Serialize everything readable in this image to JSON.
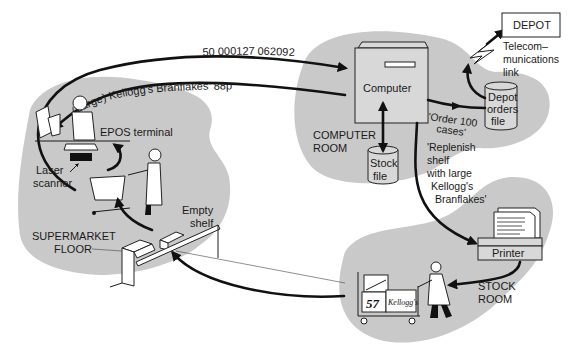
{
  "diagram": {
    "regions": {
      "supermarket_floor": "SUPERMARKET FLOOR",
      "computer_room": "COMPUTER ROOM",
      "stock_room": "STOCK ROOM"
    },
    "labels": {
      "depot": "DEPOT",
      "telecom_line1": "Telecom–",
      "telecom_line2": "munications",
      "telecom_line3": "link",
      "computer": "Computer",
      "depot_orders_line1": "Depot",
      "depot_orders_line2": "orders",
      "depot_orders_line3": "file",
      "stock_file_line1": "Stock",
      "stock_file_line2": "file",
      "epos_terminal": "EPOS terminal",
      "laser_line1": "Laser",
      "laser_line2": "scanner",
      "empty_line1": "Empty",
      "empty_line2": "shelf",
      "supermarket_line1": "SUPERMARKET",
      "supermarket_line2": "FLOOR",
      "computer_room_line1": "COMPUTER",
      "computer_room_line2": "ROOM",
      "stock_room_line1": "STOCK",
      "stock_room_line2": "ROOM",
      "printer": "Printer",
      "box_number": "57",
      "box_brand": "Kellogg's"
    },
    "messages": {
      "barcode": "50 000127 062092",
      "product_price": "(Large) Kellogg's  Branflakes' 88p",
      "order_line1": "'Order 100",
      "order_line2": "cases'",
      "replenish_line1": "'Replenish",
      "replenish_line2": "shelf",
      "replenish_line3": "with large",
      "replenish_line4": "Kellogg's",
      "replenish_line5": "Branflakes'"
    }
  }
}
